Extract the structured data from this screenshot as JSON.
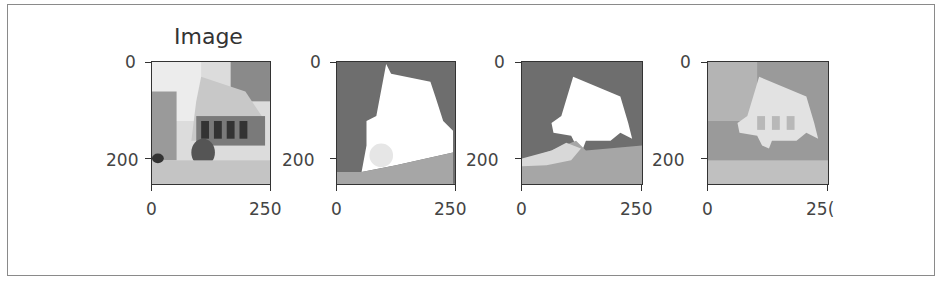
{
  "figure": {
    "panels": [
      {
        "title": "Image",
        "yticks": [
          "0",
          "200"
        ],
        "xticks": [
          "0",
          "250"
        ]
      },
      {
        "title": "",
        "yticks": [
          "0",
          "200"
        ],
        "xticks": [
          "0",
          "250"
        ]
      },
      {
        "title": "",
        "yticks": [
          "0",
          "200"
        ],
        "xticks": [
          "0",
          "250"
        ]
      },
      {
        "title": "",
        "yticks": [
          "0",
          "200"
        ],
        "xticks": [
          "0",
          "25("
        ]
      }
    ]
  },
  "colors": {
    "axis": "#333333",
    "frame": "#8a8a8a",
    "bg": "#ffffff"
  }
}
